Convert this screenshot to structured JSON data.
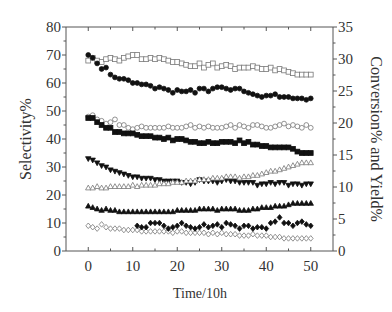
{
  "chart_data": {
    "type": "scatter",
    "title": "",
    "xlabel": "Time/10h",
    "ylabel": "Selectivity%",
    "y2label": "Conversion% and Yield%",
    "xlim": [
      -5,
      55
    ],
    "ylim": [
      0,
      80
    ],
    "y2lim": [
      0,
      35
    ],
    "xticks": [
      "0",
      "10",
      "20",
      "30",
      "40",
      "50"
    ],
    "yticks": [
      "0",
      "10",
      "20",
      "30",
      "40",
      "50",
      "60",
      "70",
      "80"
    ],
    "y2ticks": [
      "0",
      "5",
      "10",
      "15",
      "20",
      "25",
      "30",
      "35"
    ],
    "legend": "none",
    "grid": false,
    "series": [
      {
        "name": "open-squares",
        "marker": "square",
        "filled": false,
        "x": [
          0,
          1,
          2,
          3,
          4,
          5,
          6,
          7,
          8,
          9,
          10,
          11,
          12,
          13,
          14,
          15,
          16,
          17,
          18,
          19,
          20,
          21,
          22,
          23,
          24,
          25,
          26,
          27,
          28,
          29,
          30,
          31,
          32,
          33,
          34,
          35,
          36,
          37,
          38,
          39,
          40,
          41,
          42,
          43,
          44,
          45,
          46,
          47,
          48,
          49,
          50
        ],
        "y": [
          68,
          69,
          68,
          67.5,
          68.5,
          69,
          68.5,
          68,
          69,
          69.5,
          70,
          70,
          68.5,
          68.5,
          69,
          68.5,
          69,
          68.5,
          68,
          67.5,
          67.5,
          67,
          66.5,
          66,
          66,
          67,
          65.5,
          66.5,
          67,
          65.5,
          66,
          66.5,
          66,
          65,
          65.5,
          65.5,
          65.5,
          66,
          65.5,
          65,
          65,
          65.5,
          64.5,
          65,
          64.5,
          64,
          63.5,
          63,
          63,
          63,
          63
        ]
      },
      {
        "name": "filled-circles",
        "marker": "circle",
        "filled": true,
        "x": [
          0,
          1,
          2,
          3,
          4,
          5,
          6,
          7,
          8,
          9,
          10,
          11,
          12,
          13,
          14,
          15,
          16,
          17,
          18,
          19,
          20,
          21,
          22,
          23,
          24,
          25,
          26,
          27,
          28,
          29,
          30,
          31,
          32,
          33,
          34,
          35,
          36,
          37,
          38,
          39,
          40,
          41,
          42,
          43,
          44,
          45,
          46,
          47,
          48,
          49,
          50
        ],
        "y": [
          70,
          69,
          67,
          65,
          65.5,
          63,
          62,
          61.5,
          61.5,
          61,
          60,
          60,
          59.5,
          59.5,
          59,
          58,
          58.5,
          58,
          57.5,
          56.5,
          57.5,
          57,
          57,
          57.5,
          56.5,
          58,
          58,
          57,
          58,
          58.5,
          58.5,
          58,
          57.5,
          58,
          58,
          57,
          56.5,
          56,
          55.5,
          55,
          55.5,
          55.5,
          56,
          55,
          55,
          55,
          54.5,
          54.5,
          54.5,
          54,
          54.5
        ]
      },
      {
        "name": "open-circles",
        "marker": "circle",
        "filled": false,
        "x": [
          0,
          1,
          2,
          3,
          4,
          5,
          6,
          7,
          8,
          9,
          10,
          11,
          12,
          13,
          14,
          15,
          16,
          17,
          18,
          19,
          20,
          21,
          22,
          23,
          24,
          25,
          26,
          27,
          28,
          29,
          30,
          31,
          32,
          33,
          34,
          35,
          36,
          37,
          38,
          39,
          40,
          41,
          42,
          43,
          44,
          45,
          46,
          47,
          48,
          49,
          50
        ],
        "y": [
          48,
          48.5,
          47,
          46.5,
          45.5,
          46,
          47,
          45,
          45,
          44,
          43.5,
          44,
          44.5,
          44,
          44,
          44,
          44,
          44,
          44.5,
          44,
          44,
          44,
          44.5,
          45,
          44,
          44.5,
          44,
          44.5,
          44,
          44,
          44,
          44.5,
          45,
          44,
          45,
          44.5,
          44,
          45,
          45,
          44.5,
          44,
          44,
          44.5,
          45,
          45.5,
          44.5,
          45,
          44.5,
          44,
          45,
          44
        ]
      },
      {
        "name": "filled-squares",
        "marker": "square",
        "filled": true,
        "x": [
          0,
          1,
          2,
          3,
          4,
          5,
          6,
          7,
          8,
          9,
          10,
          11,
          12,
          13,
          14,
          15,
          16,
          17,
          18,
          19,
          20,
          21,
          22,
          23,
          24,
          25,
          26,
          27,
          28,
          29,
          30,
          31,
          32,
          33,
          34,
          35,
          36,
          37,
          38,
          39,
          40,
          41,
          42,
          43,
          44,
          45,
          46,
          47,
          48,
          49,
          50
        ],
        "y": [
          47.5,
          47.5,
          46,
          45,
          44,
          44,
          42.5,
          42.5,
          42,
          42,
          42,
          41.5,
          41,
          41,
          41,
          40.5,
          40.5,
          40,
          40.5,
          39.5,
          40,
          40,
          39.5,
          39,
          39,
          38.5,
          38.5,
          39,
          38.5,
          38.5,
          39,
          39,
          39,
          38.5,
          39.5,
          38.5,
          39,
          38,
          38,
          37.5,
          37.5,
          37,
          37,
          37,
          37,
          37,
          36.5,
          35.5,
          35,
          35,
          35
        ]
      },
      {
        "name": "filled-down-triangles",
        "marker": "triangle-down",
        "filled": true,
        "x": [
          0,
          1,
          2,
          3,
          4,
          5,
          6,
          7,
          8,
          9,
          10,
          11,
          12,
          13,
          14,
          15,
          16,
          17,
          18,
          19,
          20,
          21,
          22,
          23,
          24,
          25,
          26,
          27,
          28,
          29,
          30,
          31,
          32,
          33,
          34,
          35,
          36,
          37,
          38,
          39,
          40,
          41,
          42,
          43,
          44,
          45,
          46,
          47,
          48,
          49,
          50
        ],
        "y": [
          33,
          32.5,
          31.5,
          30.5,
          30,
          29,
          28.5,
          28,
          27.5,
          27,
          26.5,
          26.5,
          26,
          26,
          26,
          25.5,
          25.5,
          25,
          25,
          25,
          25,
          24.5,
          24.5,
          24,
          24.5,
          25.5,
          25,
          25,
          25,
          24.5,
          25,
          25.5,
          25,
          25,
          24.5,
          24.5,
          24.5,
          24.5,
          23.5,
          24,
          24,
          24.5,
          24,
          24.5,
          24.5,
          23.5,
          24,
          24,
          23.5,
          24,
          24
        ]
      },
      {
        "name": "open-up-triangles",
        "marker": "triangle-up",
        "filled": false,
        "x": [
          0,
          1,
          2,
          3,
          4,
          5,
          6,
          7,
          8,
          9,
          10,
          11,
          12,
          13,
          14,
          15,
          16,
          17,
          18,
          19,
          20,
          21,
          22,
          23,
          24,
          25,
          26,
          27,
          28,
          29,
          30,
          31,
          32,
          33,
          34,
          35,
          36,
          37,
          38,
          39,
          40,
          41,
          42,
          43,
          44,
          45,
          46,
          47,
          48,
          49,
          50
        ],
        "y": [
          22.5,
          22.5,
          23,
          22.5,
          22.5,
          23,
          23,
          23,
          23,
          23,
          23.5,
          23,
          23.5,
          23.5,
          23.5,
          23.5,
          24,
          24,
          24,
          24.5,
          24.5,
          24.5,
          25,
          25,
          25,
          25.5,
          25.5,
          25.5,
          26,
          26,
          26,
          26.5,
          26.5,
          26.5,
          26,
          26.5,
          26.5,
          27,
          27,
          27.5,
          28,
          28.5,
          28.5,
          29,
          29.5,
          30,
          30.5,
          31,
          31.5,
          31.5,
          31.5
        ]
      },
      {
        "name": "filled-up-triangles",
        "marker": "triangle-up",
        "filled": true,
        "x": [
          0,
          1,
          2,
          3,
          4,
          5,
          6,
          7,
          8,
          9,
          10,
          11,
          12,
          13,
          14,
          15,
          16,
          17,
          18,
          19,
          20,
          21,
          22,
          23,
          24,
          25,
          26,
          27,
          28,
          29,
          30,
          31,
          32,
          33,
          34,
          35,
          36,
          37,
          38,
          39,
          40,
          41,
          42,
          43,
          44,
          45,
          46,
          47,
          48,
          49,
          50
        ],
        "y": [
          16,
          15.5,
          15,
          14.5,
          15,
          14.5,
          14.5,
          14,
          14,
          14,
          14,
          14,
          14,
          14,
          14,
          14,
          14,
          14,
          14,
          14,
          14.5,
          14.5,
          14.5,
          14.5,
          14.5,
          15,
          15,
          15,
          15,
          14.5,
          15,
          15,
          15,
          15,
          14.5,
          14.5,
          14.5,
          15,
          15,
          15.5,
          15.5,
          15.5,
          16,
          16,
          16,
          16.5,
          17,
          17,
          17,
          17,
          17
        ]
      },
      {
        "name": "open-diamonds",
        "marker": "diamond",
        "filled": false,
        "x": [
          0,
          1,
          2,
          3,
          4,
          5,
          6,
          7,
          8,
          9,
          10,
          11,
          12,
          13,
          14,
          15,
          16,
          17,
          18,
          19,
          20,
          21,
          22,
          23,
          24,
          25,
          26,
          27,
          28,
          29,
          30,
          31,
          32,
          33,
          34,
          35,
          36,
          37,
          38,
          39,
          40,
          41,
          42,
          43,
          44,
          45,
          46,
          47,
          48,
          49,
          50
        ],
        "y": [
          9,
          8.5,
          8,
          9.5,
          8.5,
          8,
          8,
          8,
          7.5,
          7.5,
          7.5,
          7.5,
          7,
          7,
          7,
          7,
          7,
          7,
          7,
          6.5,
          7,
          7,
          6.5,
          6.5,
          6.5,
          6.5,
          6.5,
          6,
          6.5,
          6,
          6.5,
          6,
          6,
          6,
          5.5,
          5.5,
          5.5,
          6,
          5.5,
          5.5,
          5.5,
          5,
          5,
          5,
          4.5,
          4.5,
          4.5,
          4.5,
          4.5,
          4.5,
          4.5
        ]
      },
      {
        "name": "filled-diamonds",
        "marker": "diamond",
        "filled": true,
        "x": [
          11,
          12,
          13,
          14,
          15,
          16,
          17,
          18,
          19,
          20,
          21,
          22,
          23,
          24,
          25,
          26,
          27,
          28,
          29,
          30,
          31,
          32,
          33,
          34,
          35,
          36,
          37,
          38,
          39,
          40,
          41,
          42,
          43,
          44,
          45,
          46,
          47,
          48,
          49,
          50
        ],
        "y": [
          9,
          8.5,
          8.5,
          10,
          10,
          10,
          9,
          8,
          8.5,
          9,
          10,
          9,
          8.5,
          8,
          8.5,
          9.5,
          8.5,
          9,
          9.5,
          8.5,
          10,
          9.5,
          9,
          8,
          9,
          9,
          8,
          8.5,
          8.5,
          8,
          10,
          10.5,
          12,
          10,
          10,
          9,
          10,
          10.5,
          9.5,
          9
        ]
      }
    ]
  }
}
